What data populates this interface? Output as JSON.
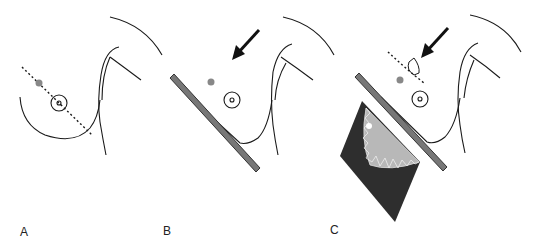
{
  "figure": {
    "panels": [
      {
        "id": "A",
        "label": "A",
        "description": "Breast profile with dotted line through lesion and nipple"
      },
      {
        "id": "B",
        "label": "B",
        "description": "Compression paddle applied at angle, arrow indicating direction"
      },
      {
        "id": "C",
        "label": "C",
        "description": "Compression paddle with detector and marker, dotted line through lesion"
      }
    ],
    "colors": {
      "outline": "#1a1a1a",
      "lesion": "#888888",
      "paddle_fill": "#777777",
      "paddle_stroke": "#333333",
      "detector_dark": "#2e2e2e",
      "detector_light": "#b8b8b8",
      "arrow": "#111111"
    }
  }
}
